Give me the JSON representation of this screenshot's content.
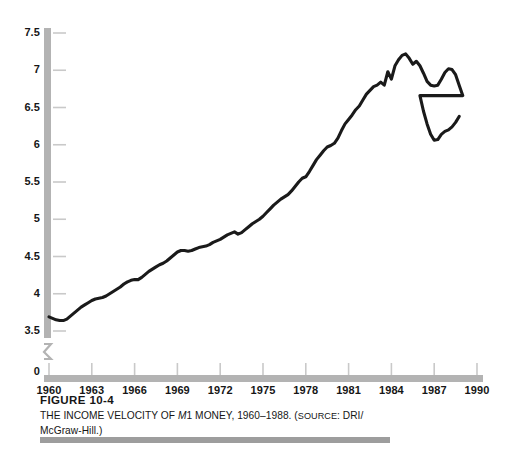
{
  "figure": {
    "number_label": "FIGURE 10-4",
    "caption_part1": "THE INCOME VELOCITY OF ",
    "caption_italic": "M",
    "caption_part2": "1 MONEY, 1960",
    "caption_dash": "–",
    "caption_part3": "1988. (",
    "caption_source_word": "SOURCE",
    "caption_part4": ": DRI/",
    "caption_line2": "McGraw-Hill.)"
  },
  "colors": {
    "axis_bar": "#b3b3b3",
    "tick": "#c9c9c9",
    "line": "#1a1a1a",
    "text": "#161616",
    "footer_rule": "#9d9d9d",
    "background": "#ffffff"
  },
  "chart_data": {
    "type": "line",
    "title": "THE INCOME VELOCITY OF M1 MONEY, 1960–1988.",
    "source": "DRI/McGraw-Hill.",
    "xlabel": "",
    "ylabel": "",
    "grid": false,
    "legend": null,
    "xlim": [
      1960,
      1990
    ],
    "ylim": [
      3.5,
      7.5
    ],
    "y_axis_break": true,
    "y_axis_break_note": "axis broken between 0 and 3.5",
    "ytick_labels": [
      "0",
      "3.5",
      "4",
      "4.5",
      "5",
      "5.5",
      "6",
      "6.5",
      "7",
      "7.5"
    ],
    "yticks": [
      3.5,
      4,
      4.5,
      5,
      5.5,
      6,
      6.5,
      7,
      7.5
    ],
    "xtick_labels": [
      "1960",
      "1963",
      "1966",
      "1969",
      "1972",
      "1975",
      "1978",
      "1981",
      "1984",
      "1987",
      "1990"
    ],
    "xticks": [
      1960,
      1963,
      1966,
      1969,
      1972,
      1975,
      1978,
      1981,
      1984,
      1987,
      1990
    ],
    "series": [
      {
        "name": "Income velocity of M1",
        "x": [
          1960.0,
          1960.25,
          1960.5,
          1960.75,
          1961.0,
          1961.25,
          1961.5,
          1961.75,
          1962.0,
          1962.25,
          1962.5,
          1962.75,
          1963.0,
          1963.25,
          1963.5,
          1963.75,
          1964.0,
          1964.25,
          1964.5,
          1964.75,
          1965.0,
          1965.25,
          1965.5,
          1965.75,
          1966.0,
          1966.25,
          1966.5,
          1966.75,
          1967.0,
          1967.25,
          1967.5,
          1967.75,
          1968.0,
          1968.25,
          1968.5,
          1968.75,
          1969.0,
          1969.25,
          1969.5,
          1969.75,
          1970.0,
          1970.25,
          1970.5,
          1970.75,
          1971.0,
          1971.25,
          1971.5,
          1971.75,
          1972.0,
          1972.25,
          1972.5,
          1972.75,
          1973.0,
          1973.25,
          1973.5,
          1973.75,
          1974.0,
          1974.25,
          1974.5,
          1974.75,
          1975.0,
          1975.25,
          1975.5,
          1975.75,
          1976.0,
          1976.25,
          1976.5,
          1976.75,
          1977.0,
          1977.25,
          1977.5,
          1977.75,
          1978.0,
          1978.25,
          1978.5,
          1978.75,
          1979.0,
          1979.25,
          1979.5,
          1979.75,
          1980.0,
          1980.25,
          1980.5,
          1980.75,
          1981.0,
          1981.25,
          1981.5,
          1981.75,
          1982.0,
          1982.25,
          1982.5,
          1982.75,
          1983.0,
          1983.25,
          1983.5,
          1983.75,
          1984.0,
          1984.25,
          1984.5,
          1984.75,
          1985.0,
          1985.25,
          1985.5,
          1985.75,
          1986.0,
          1986.25,
          1986.5,
          1986.75,
          1987.0,
          1987.25,
          1987.5,
          1987.75,
          1988.0,
          1988.25,
          1988.5,
          1988.75,
          1989.0
        ],
        "y": [
          3.69,
          3.67,
          3.65,
          3.64,
          3.64,
          3.66,
          3.7,
          3.74,
          3.78,
          3.82,
          3.85,
          3.88,
          3.91,
          3.93,
          3.94,
          3.95,
          3.97,
          4.0,
          4.03,
          4.06,
          4.09,
          4.13,
          4.16,
          4.18,
          4.19,
          4.19,
          4.22,
          4.26,
          4.3,
          4.33,
          4.36,
          4.39,
          4.41,
          4.44,
          4.48,
          4.52,
          4.56,
          4.58,
          4.58,
          4.57,
          4.58,
          4.6,
          4.62,
          4.63,
          4.64,
          4.66,
          4.69,
          4.71,
          4.73,
          4.76,
          4.79,
          4.81,
          4.83,
          4.8,
          4.82,
          4.86,
          4.9,
          4.94,
          4.97,
          5.0,
          5.04,
          5.09,
          5.14,
          5.19,
          5.23,
          5.27,
          5.3,
          5.33,
          5.38,
          5.44,
          5.5,
          5.55,
          5.57,
          5.64,
          5.72,
          5.8,
          5.86,
          5.92,
          5.97,
          5.99,
          6.02,
          6.09,
          6.19,
          6.28,
          6.34,
          6.4,
          6.47,
          6.52,
          6.6,
          6.68,
          6.73,
          6.78,
          6.8,
          6.84,
          6.8,
          6.98,
          6.88,
          7.06,
          7.14,
          7.2,
          7.22,
          7.16,
          7.08,
          7.12,
          7.06,
          6.96,
          6.85,
          6.8,
          6.79,
          6.8,
          6.88,
          6.97,
          7.02,
          7.01,
          6.94,
          6.8,
          6.66
        ]
      }
    ],
    "series_tail": {
      "note": "continued decline and recovery 1986-1989",
      "x": [
        1986.0,
        1986.25,
        1986.5,
        1986.75,
        1987.0,
        1987.25,
        1987.5,
        1987.75,
        1988.0,
        1988.25,
        1988.5,
        1988.75
      ],
      "y": [
        6.66,
        6.45,
        6.28,
        6.14,
        6.06,
        6.07,
        6.14,
        6.18,
        6.2,
        6.24,
        6.3,
        6.38
      ]
    },
    "annotations": {
      "peak_value": 7.22,
      "peak_year": 1981,
      "start_value": 3.69,
      "start_year": 1960,
      "trough_late_value": 6.06,
      "trough_late_year": 1987,
      "end_value": 6.38,
      "end_year": 1989
    }
  }
}
